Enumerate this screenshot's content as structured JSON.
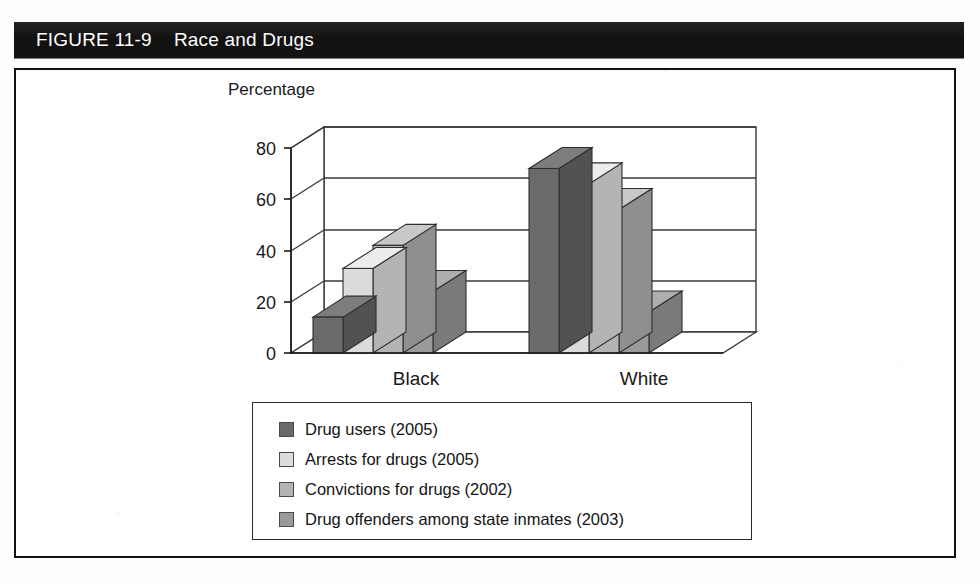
{
  "figure": {
    "number": "FIGURE 11-9",
    "caption": "Race and Drugs"
  },
  "colors": {
    "banner_bg": "#121212",
    "banner_text": "#ffffff",
    "frame_border": "#111111",
    "page_bg": "#ffffff",
    "gridline": "#3a3a3a",
    "series_1": "#6a6a6a",
    "series_1_top": "#7d7d7d",
    "series_1_side": "#525252",
    "series_2": "#dcdcdc",
    "series_2_top": "#ececec",
    "series_2_side": "#b4b4b4",
    "series_3": "#b4b4b4",
    "series_3_top": "#c8c8c8",
    "series_3_side": "#8f8f8f",
    "series_4": "#9a9a9a",
    "series_4_top": "#adadad",
    "series_4_side": "#7a7a7a"
  },
  "chart_data": {
    "type": "bar",
    "title": "Race and Drugs",
    "xlabel": "",
    "ylabel": "Percentage",
    "ylim": [
      0,
      80
    ],
    "yticks": [
      0,
      20,
      40,
      60,
      80
    ],
    "grid": true,
    "legend_position": "bottom",
    "three_d": true,
    "categories": [
      "Black",
      "White"
    ],
    "series": [
      {
        "name": "Drug users (2005)",
        "values": [
          14,
          72
        ]
      },
      {
        "name": "Arrests for drugs (2005)",
        "values": [
          33,
          66
        ]
      },
      {
        "name": "Convictions for drugs (2002)",
        "values": [
          42,
          56
        ]
      },
      {
        "name": "Drug offenders among state inmates (2003)",
        "values": [
          24,
          16
        ]
      }
    ]
  },
  "legend": {
    "items": [
      {
        "label": "Drug users (2005)",
        "swatch": "#6a6a6a"
      },
      {
        "label": "Arrests for drugs (2005)",
        "swatch": "#dcdcdc"
      },
      {
        "label": "Convictions for drugs (2002)",
        "swatch": "#b4b4b4"
      },
      {
        "label": "Drug offenders among state inmates (2003)",
        "swatch": "#9a9a9a"
      }
    ]
  },
  "axis": {
    "y_title": "Percentage",
    "y_ticks": [
      "80",
      "60",
      "40",
      "20",
      "0"
    ],
    "x_categories": [
      "Black",
      "White"
    ]
  }
}
